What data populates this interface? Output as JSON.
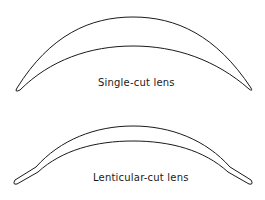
{
  "figure": {
    "diagrams": [
      {
        "id": "single-cut",
        "label": "Single-cut lens"
      },
      {
        "id": "lenticular-cut",
        "label": "Lenticular-cut lens"
      }
    ],
    "colors": {
      "stroke": "#1a1a1a",
      "background": "#ffffff"
    }
  }
}
